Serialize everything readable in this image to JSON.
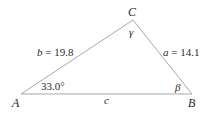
{
  "diagram": {
    "type": "triangle",
    "vertices": {
      "A": {
        "label": "A"
      },
      "B": {
        "label": "B"
      },
      "C": {
        "label": "C"
      }
    },
    "sides": {
      "a": {
        "var": "a",
        "eq": " = ",
        "value": "14.1"
      },
      "b": {
        "var": "b",
        "eq": " = ",
        "value": "19.8"
      },
      "c": {
        "var": "c"
      }
    },
    "angles": {
      "A": {
        "label": "33.0°"
      },
      "B": {
        "label": "β"
      },
      "C": {
        "label": "γ"
      }
    },
    "colors": {
      "line": "#a8a8a8",
      "text": "#2a2a2a"
    }
  }
}
